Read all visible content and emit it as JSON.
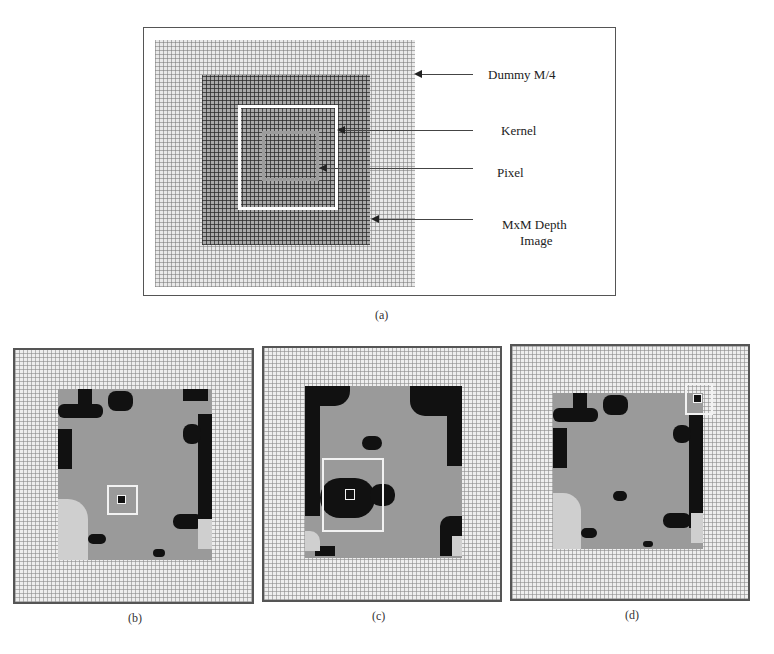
{
  "panel_a": {
    "caption": "(a)",
    "labels": {
      "dummy": "Dummy M/4",
      "kernel": "Kernel",
      "pixel": "Pixel",
      "depth_line1": "MxM Depth",
      "depth_line2": "Image"
    },
    "regions": [
      {
        "name": "dummy-padding",
        "description": "light grid border of width M/4"
      },
      {
        "name": "depth-image",
        "description": "MxM dark grid"
      },
      {
        "name": "kernel",
        "description": "white square window"
      },
      {
        "name": "pixel",
        "description": "grey inner square"
      }
    ]
  },
  "panel_b": {
    "caption": "(b)",
    "kernel_position": "center"
  },
  "panel_c": {
    "caption": "(c)",
    "kernel_position": "left-middle, larger kernel"
  },
  "panel_d": {
    "caption": "(d)",
    "kernel_position": "top-right corner, overlapping dummy border"
  },
  "colors": {
    "background": "#ffffff",
    "frame": "#555555",
    "dummy_grid": "#e9e9e9",
    "depth_grid": "#a9a9a9",
    "depth_fill": "#9a9a9a",
    "holes": "#111111",
    "kernel_outline": "#ffffff",
    "pixel_outline": "#9c9c9c"
  }
}
